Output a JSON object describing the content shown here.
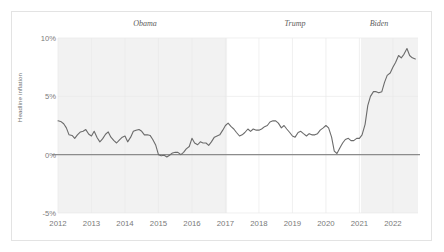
{
  "chart_data": {
    "type": "line",
    "title": "",
    "xlabel": "",
    "ylabel": "Headline inflation",
    "xlim": [
      2012.0,
      2022.75
    ],
    "ylim": [
      -5,
      10
    ],
    "yticks": [
      "-5%",
      "0%",
      "5%",
      "10%"
    ],
    "ytick_values": [
      -5,
      0,
      5,
      10
    ],
    "xticks": [
      "2012",
      "2013",
      "2014",
      "2015",
      "2016",
      "2017",
      "2018",
      "2019",
      "2020",
      "2021",
      "2022"
    ],
    "xtick_values": [
      2012,
      2013,
      2014,
      2015,
      2016,
      2017,
      2018,
      2019,
      2020,
      2021,
      2022
    ],
    "grid": true,
    "legend": "none",
    "zero_line": 0,
    "annotations": [
      {
        "label": "Obama",
        "start": 2012.0,
        "end": 2017.05,
        "shaded": true,
        "label_x": 2014.5
      },
      {
        "label": "Trump",
        "start": 2017.05,
        "end": 2021.05,
        "shaded": false,
        "label_x": 2019.05
      },
      {
        "label": "Biden",
        "start": 2021.05,
        "end": 2022.75,
        "shaded": true,
        "label_x": 2021.95
      }
    ],
    "series": [
      {
        "name": "Headline inflation",
        "color": "#6b6b6b",
        "x": [
          2012.0,
          2012.08,
          2012.17,
          2012.25,
          2012.33,
          2012.42,
          2012.5,
          2012.58,
          2012.67,
          2012.75,
          2012.83,
          2012.92,
          2013.0,
          2013.08,
          2013.17,
          2013.25,
          2013.33,
          2013.42,
          2013.5,
          2013.58,
          2013.67,
          2013.75,
          2013.83,
          2013.92,
          2014.0,
          2014.08,
          2014.17,
          2014.25,
          2014.33,
          2014.42,
          2014.5,
          2014.58,
          2014.67,
          2014.75,
          2014.83,
          2014.92,
          2015.0,
          2015.08,
          2015.17,
          2015.25,
          2015.33,
          2015.42,
          2015.5,
          2015.58,
          2015.67,
          2015.75,
          2015.83,
          2015.92,
          2016.0,
          2016.08,
          2016.17,
          2016.25,
          2016.33,
          2016.42,
          2016.5,
          2016.58,
          2016.67,
          2016.75,
          2016.83,
          2016.92,
          2017.0,
          2017.08,
          2017.17,
          2017.25,
          2017.33,
          2017.42,
          2017.5,
          2017.58,
          2017.67,
          2017.75,
          2017.83,
          2017.92,
          2018.0,
          2018.08,
          2018.17,
          2018.25,
          2018.33,
          2018.42,
          2018.5,
          2018.58,
          2018.67,
          2018.75,
          2018.83,
          2018.92,
          2019.0,
          2019.08,
          2019.17,
          2019.25,
          2019.33,
          2019.42,
          2019.5,
          2019.58,
          2019.67,
          2019.75,
          2019.83,
          2019.92,
          2020.0,
          2020.08,
          2020.17,
          2020.25,
          2020.33,
          2020.42,
          2020.5,
          2020.58,
          2020.67,
          2020.75,
          2020.83,
          2020.92,
          2021.0,
          2021.08,
          2021.17,
          2021.25,
          2021.33,
          2021.42,
          2021.5,
          2021.58,
          2021.67,
          2021.75,
          2021.83,
          2021.92,
          2022.0,
          2022.08,
          2022.17,
          2022.25,
          2022.33,
          2022.42,
          2022.5,
          2022.58,
          2022.67
        ],
        "y": [
          2.9,
          2.85,
          2.65,
          2.3,
          1.7,
          1.65,
          1.4,
          1.7,
          1.95,
          2.0,
          2.15,
          1.75,
          1.6,
          2.0,
          1.45,
          1.1,
          1.35,
          1.75,
          1.95,
          1.5,
          1.2,
          1.0,
          1.25,
          1.5,
          1.6,
          1.1,
          1.5,
          2.0,
          2.1,
          2.15,
          2.0,
          1.7,
          1.7,
          1.65,
          1.3,
          0.8,
          0.0,
          -0.1,
          -0.05,
          -0.2,
          -0.05,
          0.15,
          0.2,
          0.2,
          0.0,
          0.2,
          0.5,
          0.7,
          1.4,
          1.0,
          0.85,
          1.1,
          1.0,
          1.0,
          0.8,
          1.1,
          1.5,
          1.6,
          1.7,
          2.1,
          2.5,
          2.7,
          2.4,
          2.2,
          1.9,
          1.6,
          1.7,
          1.9,
          2.2,
          2.0,
          2.2,
          2.1,
          2.1,
          2.2,
          2.4,
          2.5,
          2.8,
          2.9,
          2.9,
          2.7,
          2.3,
          2.5,
          2.2,
          1.9,
          1.6,
          1.5,
          1.9,
          2.0,
          1.8,
          1.6,
          1.8,
          1.7,
          1.7,
          1.8,
          2.1,
          2.3,
          2.5,
          2.3,
          1.5,
          0.3,
          0.1,
          0.6,
          1.0,
          1.3,
          1.4,
          1.2,
          1.2,
          1.4,
          1.4,
          1.7,
          2.6,
          4.2,
          5.0,
          5.4,
          5.4,
          5.3,
          5.4,
          6.2,
          6.8,
          7.0,
          7.5,
          7.9,
          8.5,
          8.3,
          8.6,
          9.1,
          8.5,
          8.3,
          8.2
        ]
      }
    ]
  },
  "axis": {
    "y_label": "Headline inflation",
    "y_ticks": [
      "10%",
      "5%",
      "0%",
      "-5%"
    ],
    "x_ticks": [
      "2012",
      "2013",
      "2014",
      "2015",
      "2016",
      "2017",
      "2018",
      "2019",
      "2020",
      "2021",
      "2022"
    ]
  },
  "eras": [
    {
      "name": "Obama"
    },
    {
      "name": "Trump"
    },
    {
      "name": "Biden"
    }
  ],
  "colors": {
    "line": "#6b6b6b",
    "shade": "#f2f2f2",
    "grid": "#eaeaea",
    "zero_line": "#8c8c8c",
    "text": "#7a7a7a",
    "frame": "#e3e3e3"
  }
}
